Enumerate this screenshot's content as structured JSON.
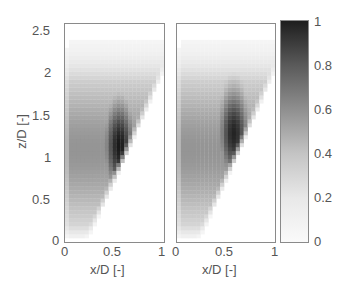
{
  "chart_data": {
    "type": "heatmap",
    "title": "",
    "panels": [
      {
        "name": "left",
        "xlabel": "x/D [-]",
        "ylabel": "z/D [-]",
        "xlim": [
          0,
          1
        ],
        "ylim": [
          0,
          2.6
        ],
        "xticks": [
          "0",
          "0.5",
          "1"
        ],
        "yticks": [
          "0",
          "0.5",
          "1",
          "1.5",
          "2",
          "2.5"
        ],
        "peak": {
          "x": 0.55,
          "z": 1.15,
          "value": 1.0
        },
        "description": "Grayscale plume: dark core near x/D≈0.5-0.6, z/D≈0.8-1.5; sharp lower-right edge running from (0.2,0.1) to (0.85,1.8); diffuse fade toward top above z/D≈2"
      },
      {
        "name": "right",
        "xlabel": "x/D [-]",
        "ylabel": "",
        "xlim": [
          0,
          1
        ],
        "ylim": [
          0,
          2.6
        ],
        "xticks": [
          "0",
          "0.5",
          "1"
        ],
        "peak": {
          "x": 0.58,
          "z": 1.3,
          "value": 0.95
        },
        "description": "Similar plume shape, slightly broader and smoother, dark core near x/D≈0.55-0.65, z/D≈1.0-1.6"
      }
    ],
    "colorbar": {
      "colormap": "gray_reversed",
      "range": [
        0,
        1
      ],
      "ticks": [
        "0",
        "0.2",
        "0.4",
        "0.6",
        "0.8",
        "1"
      ]
    }
  },
  "labels": {
    "left_ylabel": "z/D [-]",
    "left_xlabel": "x/D [-]",
    "right_xlabel": "x/D [-]"
  },
  "ticks": {
    "y": [
      "0",
      "0.5",
      "1",
      "1.5",
      "2",
      "2.5"
    ],
    "x": [
      "0",
      "0.5",
      "1"
    ],
    "cb": [
      "0",
      "0.2",
      "0.4",
      "0.6",
      "0.8",
      "1"
    ]
  }
}
